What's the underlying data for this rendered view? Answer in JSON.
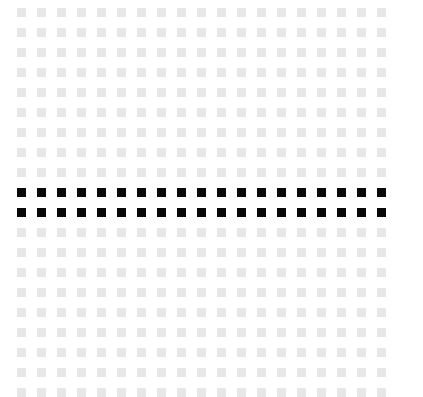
{
  "canvas": {
    "width": 423,
    "height": 396,
    "background_color": "#ffffff"
  },
  "pattern": {
    "type": "square-dot-grid",
    "columns": 19,
    "rows": 20,
    "cell_size": 9,
    "pitch_x": 20,
    "pitch_y": 20,
    "origin_x": 17,
    "origin_y": 8,
    "default_color": "#e7e7e7",
    "highlight_color": "#080808",
    "highlighted_rows": [
      9,
      10
    ],
    "highlighted_row_count": 2,
    "total_cells": 380,
    "highlighted_cells": 38
  },
  "chart_data": {
    "type": "heatmap",
    "title": "",
    "xlabel": "",
    "ylabel": "",
    "columns": 19,
    "rows": 20,
    "legend": [
      {
        "label": "inactive",
        "color": "#e7e7e7",
        "value": 0
      },
      {
        "label": "active",
        "color": "#080808",
        "value": 1
      }
    ],
    "row_values": [
      [
        0,
        0,
        0,
        0,
        0,
        0,
        0,
        0,
        0,
        0,
        0,
        0,
        0,
        0,
        0,
        0,
        0,
        0,
        0
      ],
      [
        0,
        0,
        0,
        0,
        0,
        0,
        0,
        0,
        0,
        0,
        0,
        0,
        0,
        0,
        0,
        0,
        0,
        0,
        0
      ],
      [
        0,
        0,
        0,
        0,
        0,
        0,
        0,
        0,
        0,
        0,
        0,
        0,
        0,
        0,
        0,
        0,
        0,
        0,
        0
      ],
      [
        0,
        0,
        0,
        0,
        0,
        0,
        0,
        0,
        0,
        0,
        0,
        0,
        0,
        0,
        0,
        0,
        0,
        0,
        0
      ],
      [
        0,
        0,
        0,
        0,
        0,
        0,
        0,
        0,
        0,
        0,
        0,
        0,
        0,
        0,
        0,
        0,
        0,
        0,
        0
      ],
      [
        0,
        0,
        0,
        0,
        0,
        0,
        0,
        0,
        0,
        0,
        0,
        0,
        0,
        0,
        0,
        0,
        0,
        0,
        0
      ],
      [
        0,
        0,
        0,
        0,
        0,
        0,
        0,
        0,
        0,
        0,
        0,
        0,
        0,
        0,
        0,
        0,
        0,
        0,
        0
      ],
      [
        0,
        0,
        0,
        0,
        0,
        0,
        0,
        0,
        0,
        0,
        0,
        0,
        0,
        0,
        0,
        0,
        0,
        0,
        0
      ],
      [
        0,
        0,
        0,
        0,
        0,
        0,
        0,
        0,
        0,
        0,
        0,
        0,
        0,
        0,
        0,
        0,
        0,
        0,
        0
      ],
      [
        1,
        1,
        1,
        1,
        1,
        1,
        1,
        1,
        1,
        1,
        1,
        1,
        1,
        1,
        1,
        1,
        1,
        1,
        1
      ],
      [
        1,
        1,
        1,
        1,
        1,
        1,
        1,
        1,
        1,
        1,
        1,
        1,
        1,
        1,
        1,
        1,
        1,
        1,
        1
      ],
      [
        0,
        0,
        0,
        0,
        0,
        0,
        0,
        0,
        0,
        0,
        0,
        0,
        0,
        0,
        0,
        0,
        0,
        0,
        0
      ],
      [
        0,
        0,
        0,
        0,
        0,
        0,
        0,
        0,
        0,
        0,
        0,
        0,
        0,
        0,
        0,
        0,
        0,
        0,
        0
      ],
      [
        0,
        0,
        0,
        0,
        0,
        0,
        0,
        0,
        0,
        0,
        0,
        0,
        0,
        0,
        0,
        0,
        0,
        0,
        0
      ],
      [
        0,
        0,
        0,
        0,
        0,
        0,
        0,
        0,
        0,
        0,
        0,
        0,
        0,
        0,
        0,
        0,
        0,
        0,
        0
      ],
      [
        0,
        0,
        0,
        0,
        0,
        0,
        0,
        0,
        0,
        0,
        0,
        0,
        0,
        0,
        0,
        0,
        0,
        0,
        0
      ],
      [
        0,
        0,
        0,
        0,
        0,
        0,
        0,
        0,
        0,
        0,
        0,
        0,
        0,
        0,
        0,
        0,
        0,
        0,
        0
      ],
      [
        0,
        0,
        0,
        0,
        0,
        0,
        0,
        0,
        0,
        0,
        0,
        0,
        0,
        0,
        0,
        0,
        0,
        0,
        0
      ],
      [
        0,
        0,
        0,
        0,
        0,
        0,
        0,
        0,
        0,
        0,
        0,
        0,
        0,
        0,
        0,
        0,
        0,
        0,
        0
      ],
      [
        0,
        0,
        0,
        0,
        0,
        0,
        0,
        0,
        0,
        0,
        0,
        0,
        0,
        0,
        0,
        0,
        0,
        0,
        0
      ]
    ]
  }
}
